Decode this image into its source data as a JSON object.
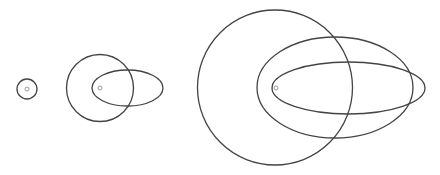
{
  "diagram": {
    "width": 440,
    "height": 175,
    "background": "#ffffff",
    "line_color": "#444444",
    "dot_color": "#999999",
    "groups": [
      {
        "name": "group-small",
        "focus": {
          "cx": 27,
          "cy": 89,
          "r": 2
        },
        "circles": [
          {
            "cx": 27,
            "cy": 89,
            "r": 10
          }
        ],
        "ellipses": []
      },
      {
        "name": "group-medium",
        "focus": {
          "cx": 100,
          "cy": 88,
          "r": 2
        },
        "circles": [
          {
            "cx": 100,
            "cy": 88,
            "r": 33.5
          }
        ],
        "ellipses": [
          {
            "cx": 127.5,
            "cy": 88,
            "rx": 35.5,
            "ry": 18
          }
        ]
      },
      {
        "name": "group-large",
        "focus": {
          "cx": 276,
          "cy": 88,
          "r": 2
        },
        "circles": [
          {
            "cx": 275,
            "cy": 87.5,
            "r": 77.5
          }
        ],
        "ellipses": [
          {
            "cx": 335,
            "cy": 87.5,
            "rx": 78,
            "ry": 50.5
          },
          {
            "cx": 348.5,
            "cy": 88,
            "rx": 76.5,
            "ry": 26
          }
        ]
      }
    ]
  }
}
